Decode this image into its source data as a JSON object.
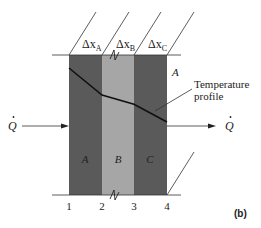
{
  "figure": {
    "panel_label": "(b)"
  },
  "layers": [
    {
      "name": "A",
      "thickness_label": "Δx",
      "thickness_sub": "A",
      "color": "#5a5a5a"
    },
    {
      "name": "B",
      "thickness_label": "Δx",
      "thickness_sub": "B",
      "color": "#a6a6a6"
    },
    {
      "name": "C",
      "thickness_label": "Δx",
      "thickness_sub": "C",
      "color": "#5a5a5a"
    }
  ],
  "interfaces": [
    "1",
    "2",
    "3",
    "4"
  ],
  "heat_flow": {
    "in_label": "Q",
    "out_label": "Q"
  },
  "area_label": "A",
  "temperature_profile": {
    "label_line1": "Temperature",
    "label_line2": "profile",
    "relative_temps": [
      1.0,
      0.5,
      0.33,
      0.0
    ]
  },
  "colors": {
    "line": "#111111",
    "thin_line": "#333333"
  }
}
